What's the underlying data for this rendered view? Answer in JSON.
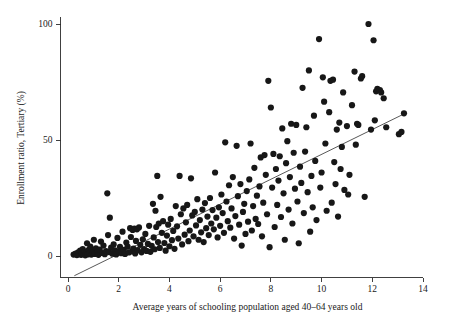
{
  "chart_data": {
    "type": "scatter",
    "title": "",
    "subtitle": "",
    "xlabel": "Average years of schooling population aged 40–64 years old",
    "ylabel": "Enrollment ratio, Tertiary (%)",
    "xlim": [
      0,
      14
    ],
    "ylim": [
      0,
      100
    ],
    "xticks": [
      0,
      2,
      4,
      6,
      8,
      10,
      12,
      14
    ],
    "xticklabels": [
      "0",
      "2",
      "4",
      "6",
      "8",
      "10",
      "12",
      "14"
    ],
    "yticks": [
      0,
      50,
      100
    ],
    "yticklabels": [
      "0",
      "50",
      "100"
    ],
    "grid": false,
    "legend": null,
    "legend_position": "none",
    "marker_color": "#171717",
    "marker_size": 3.1,
    "fit_line": {
      "label": "linear fit",
      "color": "#3a3a3a",
      "x_start": 0.25,
      "y_start": -8.5,
      "x_end": 13.3,
      "y_end": 61.5,
      "slope": 5.36,
      "intercept": -9.84
    },
    "series": [
      {
        "name": "countries",
        "marker": "circle",
        "color": "#171717",
        "points": [
          [
            0.22,
            0.6
          ],
          [
            0.3,
            1.0
          ],
          [
            0.35,
            0.4
          ],
          [
            0.4,
            1.6
          ],
          [
            0.45,
            0.8
          ],
          [
            0.48,
            2.3
          ],
          [
            0.52,
            0.5
          ],
          [
            0.55,
            1.2
          ],
          [
            0.58,
            3.0
          ],
          [
            0.62,
            0.9
          ],
          [
            0.65,
            2.0
          ],
          [
            0.68,
            0.3
          ],
          [
            0.72,
            1.4
          ],
          [
            0.75,
            5.5
          ],
          [
            0.78,
            0.7
          ],
          [
            0.82,
            2.6
          ],
          [
            0.85,
            1.1
          ],
          [
            0.88,
            4.0
          ],
          [
            0.92,
            0.6
          ],
          [
            0.95,
            2.2
          ],
          [
            0.98,
            1.5
          ],
          [
            1.02,
            7.0
          ],
          [
            1.05,
            0.9
          ],
          [
            1.1,
            3.3
          ],
          [
            1.15,
            1.8
          ],
          [
            1.2,
            0.5
          ],
          [
            1.25,
            2.8
          ],
          [
            1.3,
            6.2
          ],
          [
            1.35,
            1.3
          ],
          [
            1.4,
            4.5
          ],
          [
            1.45,
            0.8
          ],
          [
            1.5,
            2.1
          ],
          [
            1.55,
            27.0
          ],
          [
            1.58,
            9.0
          ],
          [
            1.62,
            1.7
          ],
          [
            1.65,
            16.5
          ],
          [
            1.7,
            3.6
          ],
          [
            1.75,
            1.0
          ],
          [
            1.8,
            5.0
          ],
          [
            1.85,
            2.4
          ],
          [
            1.9,
            0.7
          ],
          [
            1.95,
            7.8
          ],
          [
            2.0,
            1.9
          ],
          [
            2.05,
            3.9
          ],
          [
            2.1,
            1.2
          ],
          [
            2.15,
            10.5
          ],
          [
            2.2,
            2.7
          ],
          [
            2.25,
            0.9
          ],
          [
            2.3,
            5.8
          ],
          [
            2.35,
            4.1
          ],
          [
            2.4,
            1.5
          ],
          [
            2.45,
            12.0
          ],
          [
            2.48,
            8.2
          ],
          [
            2.52,
            2.0
          ],
          [
            2.55,
            11.2
          ],
          [
            2.58,
            3.2
          ],
          [
            2.62,
            11.8
          ],
          [
            2.65,
            1.1
          ],
          [
            2.68,
            6.5
          ],
          [
            2.72,
            11.5
          ],
          [
            2.75,
            2.5
          ],
          [
            2.8,
            12.3
          ],
          [
            2.85,
            4.8
          ],
          [
            2.9,
            1.6
          ],
          [
            2.95,
            7.2
          ],
          [
            3.0,
            3.0
          ],
          [
            3.05,
            9.5
          ],
          [
            3.1,
            2.2
          ],
          [
            3.15,
            5.2
          ],
          [
            3.2,
            13.0
          ],
          [
            3.25,
            1.8
          ],
          [
            3.3,
            4.4
          ],
          [
            3.35,
            22.5
          ],
          [
            3.38,
            8.0
          ],
          [
            3.42,
            2.9
          ],
          [
            3.45,
            19.5
          ],
          [
            3.48,
            12.5
          ],
          [
            3.52,
            34.5
          ],
          [
            3.55,
            6.0
          ],
          [
            3.58,
            14.0
          ],
          [
            3.62,
            3.5
          ],
          [
            3.65,
            25.5
          ],
          [
            3.7,
            10.0
          ],
          [
            3.75,
            15.0
          ],
          [
            3.8,
            5.6
          ],
          [
            3.85,
            2.3
          ],
          [
            3.9,
            8.8
          ],
          [
            3.95,
            13.5
          ],
          [
            4.0,
            4.2
          ],
          [
            4.05,
            16.0
          ],
          [
            4.1,
            6.8
          ],
          [
            4.15,
            10.8
          ],
          [
            4.2,
            3.1
          ],
          [
            4.25,
            21.5
          ],
          [
            4.3,
            12.8
          ],
          [
            4.35,
            7.5
          ],
          [
            4.4,
            34.5
          ],
          [
            4.45,
            18.0
          ],
          [
            4.5,
            5.0
          ],
          [
            4.55,
            20.5
          ],
          [
            4.6,
            9.2
          ],
          [
            4.65,
            14.5
          ],
          [
            4.7,
            22.0
          ],
          [
            4.75,
            6.4
          ],
          [
            4.8,
            11.0
          ],
          [
            4.85,
            33.5
          ],
          [
            4.9,
            17.5
          ],
          [
            4.95,
            8.5
          ],
          [
            5.0,
            19.0
          ],
          [
            5.05,
            13.2
          ],
          [
            5.1,
            24.5
          ],
          [
            5.15,
            7.0
          ],
          [
            5.2,
            15.5
          ],
          [
            5.25,
            10.2
          ],
          [
            5.3,
            20.0
          ],
          [
            5.35,
            6.0
          ],
          [
            5.4,
            22.8
          ],
          [
            5.45,
            12.0
          ],
          [
            5.5,
            17.0
          ],
          [
            5.55,
            9.0
          ],
          [
            5.6,
            25.0
          ],
          [
            5.65,
            14.0
          ],
          [
            5.7,
            19.8
          ],
          [
            5.75,
            11.5
          ],
          [
            5.8,
            36.0
          ],
          [
            5.85,
            16.5
          ],
          [
            5.9,
            8.0
          ],
          [
            5.95,
            21.0
          ],
          [
            6.0,
            13.0
          ],
          [
            6.05,
            26.5
          ],
          [
            6.1,
            18.5
          ],
          [
            6.15,
            10.0
          ],
          [
            6.2,
            49.0
          ],
          [
            6.25,
            23.5
          ],
          [
            6.3,
            15.0
          ],
          [
            6.35,
            30.5
          ],
          [
            6.4,
            12.2
          ],
          [
            6.45,
            20.5
          ],
          [
            6.5,
            34.0
          ],
          [
            6.55,
            7.5
          ],
          [
            6.6,
            17.2
          ],
          [
            6.65,
            47.5
          ],
          [
            6.7,
            25.8
          ],
          [
            6.75,
            13.5
          ],
          [
            6.8,
            31.0
          ],
          [
            6.85,
            4.5
          ],
          [
            6.9,
            19.0
          ],
          [
            6.95,
            22.5
          ],
          [
            7.0,
            9.5
          ],
          [
            7.05,
            28.0
          ],
          [
            7.1,
            14.8
          ],
          [
            7.15,
            33.0
          ],
          [
            7.2,
            48.5
          ],
          [
            7.25,
            11.0
          ],
          [
            7.3,
            21.5
          ],
          [
            7.35,
            38.0
          ],
          [
            7.4,
            16.0
          ],
          [
            7.45,
            26.0
          ],
          [
            7.5,
            13.8
          ],
          [
            7.55,
            30.0
          ],
          [
            7.6,
            42.5
          ],
          [
            7.65,
            8.5
          ],
          [
            7.7,
            23.0
          ],
          [
            7.75,
            43.5
          ],
          [
            7.8,
            35.0
          ],
          [
            7.85,
            18.0
          ],
          [
            7.9,
            75.5
          ],
          [
            7.95,
            3.8
          ],
          [
            8.0,
            64.0
          ],
          [
            8.05,
            29.5
          ],
          [
            8.1,
            44.0
          ],
          [
            8.15,
            12.5
          ],
          [
            8.2,
            37.5
          ],
          [
            8.25,
            22.0
          ],
          [
            8.3,
            32.5
          ],
          [
            8.35,
            43.0
          ],
          [
            8.4,
            16.8
          ],
          [
            8.45,
            55.0
          ],
          [
            8.5,
            27.0
          ],
          [
            8.55,
            7.0
          ],
          [
            8.6,
            40.0
          ],
          [
            8.65,
            49.5
          ],
          [
            8.7,
            20.0
          ],
          [
            8.75,
            34.0
          ],
          [
            8.8,
            57.0
          ],
          [
            8.85,
            14.0
          ],
          [
            8.9,
            44.5
          ],
          [
            8.95,
            29.0
          ],
          [
            9.0,
            56.5
          ],
          [
            9.05,
            23.5
          ],
          [
            9.1,
            5.5
          ],
          [
            9.15,
            38.5
          ],
          [
            9.2,
            31.5
          ],
          [
            9.25,
            72.5
          ],
          [
            9.3,
            18.5
          ],
          [
            9.35,
            45.0
          ],
          [
            9.4,
            55.5
          ],
          [
            9.45,
            27.5
          ],
          [
            9.5,
            80.0
          ],
          [
            9.55,
            10.5
          ],
          [
            9.6,
            34.5
          ],
          [
            9.65,
            21.0
          ],
          [
            9.7,
            60.5
          ],
          [
            9.75,
            41.0
          ],
          [
            9.8,
            15.5
          ],
          [
            9.9,
            93.5
          ],
          [
            9.95,
            29.5
          ],
          [
            10.0,
            36.0
          ],
          [
            10.05,
            77.0
          ],
          [
            10.1,
            66.5
          ],
          [
            10.15,
            48.5
          ],
          [
            10.2,
            19.5
          ],
          [
            10.3,
            62.0
          ],
          [
            10.35,
            75.5
          ],
          [
            10.4,
            23.0
          ],
          [
            10.45,
            76.0
          ],
          [
            10.5,
            40.5
          ],
          [
            10.55,
            31.0
          ],
          [
            10.6,
            54.5
          ],
          [
            10.65,
            17.0
          ],
          [
            10.7,
            57.5
          ],
          [
            10.75,
            37.5
          ],
          [
            10.8,
            47.0
          ],
          [
            10.85,
            70.5
          ],
          [
            10.9,
            28.5
          ],
          [
            11.0,
            56.0
          ],
          [
            11.05,
            26.5
          ],
          [
            11.1,
            35.0
          ],
          [
            11.2,
            65.0
          ],
          [
            11.3,
            79.5
          ],
          [
            11.35,
            48.0
          ],
          [
            11.4,
            57.0
          ],
          [
            11.45,
            56.5
          ],
          [
            11.55,
            76.5
          ],
          [
            11.6,
            77.5
          ],
          [
            11.7,
            25.5
          ],
          [
            11.85,
            100.0
          ],
          [
            11.95,
            54.5
          ],
          [
            12.05,
            93.0
          ],
          [
            12.1,
            58.5
          ],
          [
            12.15,
            71.0
          ],
          [
            12.2,
            72.0
          ],
          [
            12.3,
            71.5
          ],
          [
            12.35,
            70.5
          ],
          [
            12.45,
            68.0
          ],
          [
            12.55,
            55.5
          ],
          [
            13.05,
            52.5
          ],
          [
            13.15,
            53.5
          ],
          [
            13.25,
            61.5
          ]
        ]
      }
    ]
  },
  "axes": {
    "y_tick_labels": [
      "100",
      "50",
      "0"
    ],
    "x_tick_labels": [
      "0",
      "2",
      "4",
      "6",
      "8",
      "10",
      "12",
      "14"
    ],
    "x_axis_title": "Average years of schooling population aged 40–64 years old",
    "y_axis_title": "Enrollment ratio, Tertiary (%)"
  }
}
